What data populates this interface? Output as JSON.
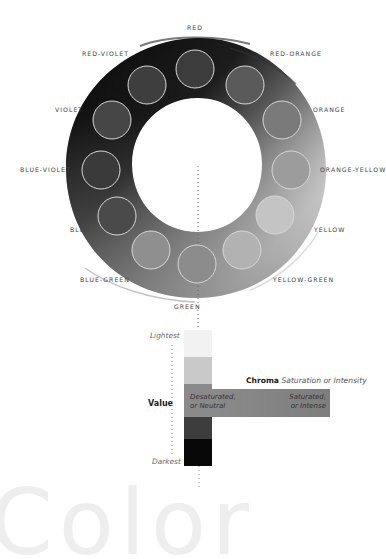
{
  "wheel": {
    "hues": [
      {
        "name": "RED",
        "label": "RED",
        "cx": 195,
        "cy": 69,
        "fill": "#3c3c3c",
        "lx": 187,
        "ly": 24
      },
      {
        "name": "RED-ORANGE",
        "label": "RED-ORANGE",
        "cx": 245,
        "cy": 85,
        "fill": "#5a5a5a",
        "lx": 270,
        "ly": 50
      },
      {
        "name": "ORANGE",
        "label": "ORANGE",
        "cx": 282,
        "cy": 120,
        "fill": "#7a7a7a",
        "lx": 313,
        "ly": 106
      },
      {
        "name": "ORANGE-YELLOW",
        "label": "ORANGE-YELLOW",
        "cx": 291,
        "cy": 170,
        "fill": "#9c9c9c",
        "lx": 320,
        "ly": 166
      },
      {
        "name": "YELLOW",
        "label": "YELLOW",
        "cx": 275,
        "cy": 215,
        "fill": "#c4c4c4",
        "lx": 314,
        "ly": 226
      },
      {
        "name": "YELLOW-GREEN",
        "label": "YELLOW-GREEN",
        "cx": 242,
        "cy": 250,
        "fill": "#b2b2b2",
        "lx": 273,
        "ly": 276
      },
      {
        "name": "GREEN",
        "label": "GREEN",
        "cx": 197,
        "cy": 264,
        "fill": "#8c8c8c",
        "lx": 174,
        "ly": 303
      },
      {
        "name": "BLUE-GREEN",
        "label": "BLUE-GREEN",
        "cx": 151,
        "cy": 250,
        "fill": "#8f8f8f",
        "lx": 80,
        "ly": 276
      },
      {
        "name": "BLUE",
        "label": "BLUE",
        "cx": 117,
        "cy": 216,
        "fill": "#4a4a4a",
        "lx": 70,
        "ly": 226
      },
      {
        "name": "BLUE-VIOLET",
        "label": "BLUE-VIOLET",
        "cx": 101,
        "cy": 170,
        "fill": "#3a3a3a",
        "lx": 20,
        "ly": 166
      },
      {
        "name": "VIOLET",
        "label": "VIOLET",
        "cx": 112,
        "cy": 120,
        "fill": "#464646",
        "lx": 55,
        "ly": 106
      },
      {
        "name": "RED-VIOLET",
        "label": "RED-VIOLET",
        "cx": 147,
        "cy": 85,
        "fill": "#3e3e3e",
        "lx": 82,
        "ly": 50
      }
    ]
  },
  "value_scale": {
    "title": "Value",
    "top_label": "Lightest",
    "bottom_label": "Darkest",
    "segments": [
      "#f2f2f2",
      "#c9c9c9",
      "#8a8a8a",
      "#3d3d3d",
      "#080808"
    ]
  },
  "chroma": {
    "title": "Chroma",
    "subtitle": "Saturation or Intensity",
    "left_line1": "Desaturated,",
    "left_line2": "or Neutral",
    "right_line1": "Saturated,",
    "right_line2": "or Intense"
  },
  "background_word": "Color"
}
